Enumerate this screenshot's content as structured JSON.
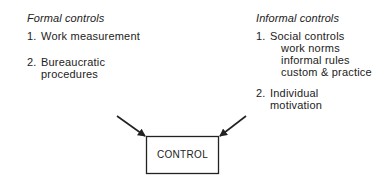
{
  "formal": {
    "heading": "Formal controls",
    "items": [
      {
        "num": "1.",
        "lines": [
          "Work measurement"
        ]
      },
      {
        "num": "2.",
        "lines": [
          "Bureaucratic",
          "procedures"
        ]
      }
    ]
  },
  "informal": {
    "heading": "Informal controls",
    "items": [
      {
        "num": "1.",
        "lines": [
          "Social controls"
        ],
        "subitems": [
          "work norms",
          "informal rules",
          "custom & practice"
        ]
      },
      {
        "num": "2.",
        "lines": [
          "Individual",
          "motivation"
        ]
      }
    ]
  },
  "control_box": {
    "label": "CONTROL"
  },
  "colors": {
    "ink": "#222222",
    "background": "#ffffff"
  }
}
